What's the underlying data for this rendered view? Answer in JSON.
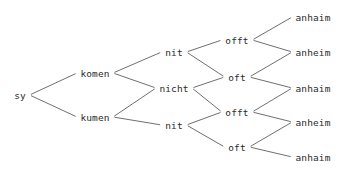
{
  "diagram": {
    "type": "word-variant-lattice",
    "title": "",
    "background_color": "#ffffff",
    "text_color": "#2b2b2b",
    "edge_color": "#4a4a4a",
    "edge_width": 0.8,
    "width": 350,
    "height": 179,
    "columns": [
      {
        "index": 0,
        "name": "column-sy",
        "nodes": [
          {
            "id": "n0",
            "label": "sy",
            "x": 20,
            "y": 95
          }
        ]
      },
      {
        "index": 1,
        "name": "column-komen",
        "nodes": [
          {
            "id": "n1",
            "label": "komen",
            "x": 95,
            "y": 73
          },
          {
            "id": "n2",
            "label": "kumen",
            "x": 95,
            "y": 117
          }
        ]
      },
      {
        "index": 2,
        "name": "column-nit",
        "nodes": [
          {
            "id": "n3",
            "label": "nit",
            "x": 174,
            "y": 52
          },
          {
            "id": "n4",
            "label": "nicht",
            "x": 174,
            "y": 88
          },
          {
            "id": "n5",
            "label": "nit",
            "x": 174,
            "y": 125
          }
        ]
      },
      {
        "index": 3,
        "name": "column-offt",
        "nodes": [
          {
            "id": "n6",
            "label": "offt",
            "x": 237,
            "y": 40
          },
          {
            "id": "n7",
            "label": "oft",
            "x": 237,
            "y": 77
          },
          {
            "id": "n8",
            "label": "offt",
            "x": 237,
            "y": 112
          },
          {
            "id": "n9",
            "label": "oft",
            "x": 237,
            "y": 147
          }
        ]
      },
      {
        "index": 4,
        "name": "column-anhaim",
        "nodes": [
          {
            "id": "n10",
            "label": "anhaim",
            "x": 313,
            "y": 17
          },
          {
            "id": "n11",
            "label": "anheim",
            "x": 313,
            "y": 52
          },
          {
            "id": "n12",
            "label": "anhaim",
            "x": 313,
            "y": 88
          },
          {
            "id": "n13",
            "label": "anheim",
            "x": 313,
            "y": 122
          },
          {
            "id": "n14",
            "label": "anhaim",
            "x": 313,
            "y": 157
          }
        ]
      }
    ],
    "edges": [
      {
        "from": "n0",
        "to": "n1"
      },
      {
        "from": "n0",
        "to": "n2"
      },
      {
        "from": "n1",
        "to": "n3"
      },
      {
        "from": "n1",
        "to": "n4"
      },
      {
        "from": "n2",
        "to": "n4"
      },
      {
        "from": "n2",
        "to": "n5"
      },
      {
        "from": "n3",
        "to": "n6"
      },
      {
        "from": "n3",
        "to": "n7"
      },
      {
        "from": "n4",
        "to": "n7"
      },
      {
        "from": "n4",
        "to": "n8"
      },
      {
        "from": "n5",
        "to": "n8"
      },
      {
        "from": "n5",
        "to": "n9"
      },
      {
        "from": "n6",
        "to": "n10"
      },
      {
        "from": "n6",
        "to": "n11"
      },
      {
        "from": "n7",
        "to": "n11"
      },
      {
        "from": "n7",
        "to": "n12"
      },
      {
        "from": "n8",
        "to": "n12"
      },
      {
        "from": "n8",
        "to": "n13"
      },
      {
        "from": "n9",
        "to": "n13"
      },
      {
        "from": "n9",
        "to": "n14"
      }
    ]
  }
}
